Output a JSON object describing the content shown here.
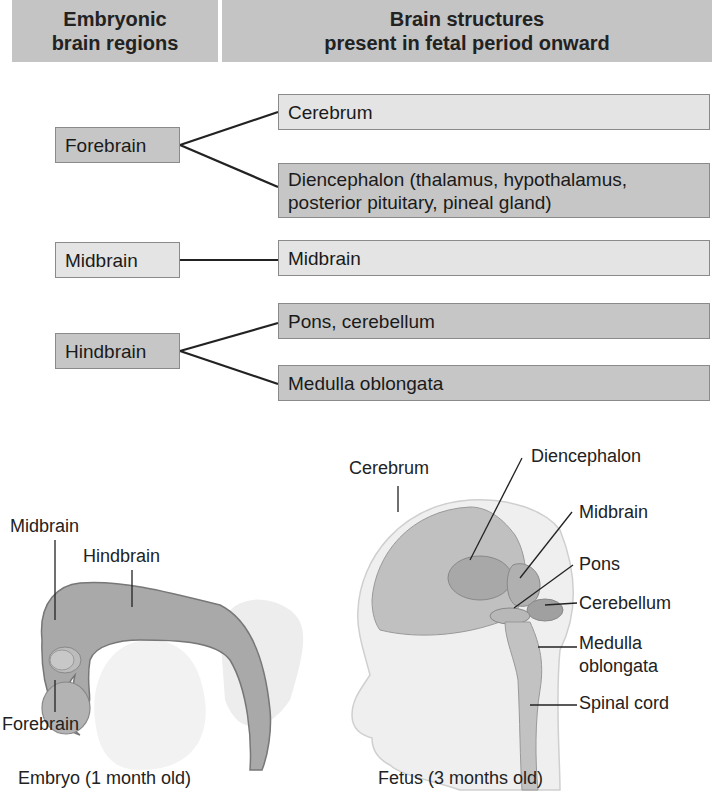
{
  "header": {
    "left": "Embryonic brain regions",
    "left_lines": [
      "Embryonic",
      "brain regions"
    ],
    "right_lines": [
      "Brain structures",
      "present in fetal period onward"
    ]
  },
  "table": {
    "rows": [
      {
        "region": "Forebrain",
        "structures": [
          "Cerebrum",
          "Diencephalon (thalamus, hypothalamus, posterior pituitary, pineal gland)"
        ]
      },
      {
        "region": "Midbrain",
        "structures": [
          "Midbrain"
        ]
      },
      {
        "region": "Hindbrain",
        "structures": [
          "Pons, cerebellum",
          "Medulla oblongata"
        ]
      }
    ],
    "diencephalon_lines": [
      "Diencephalon (thalamus, hypothalamus,",
      "posterior pituitary, pineal gland)"
    ]
  },
  "embryo": {
    "labels": [
      "Midbrain",
      "Hindbrain",
      "Forebrain"
    ],
    "caption": "Embryo (1 month old)"
  },
  "fetus": {
    "labels": [
      "Cerebrum",
      "Diencephalon",
      "Midbrain",
      "Pons",
      "Cerebellum",
      "Medulla",
      "oblongata",
      "Spinal cord"
    ],
    "caption": "Fetus (3 months old)"
  },
  "colors": {
    "header": "#c4c4c4",
    "dark_box": "#c6c6c6",
    "light_box": "#e4e4e4"
  }
}
